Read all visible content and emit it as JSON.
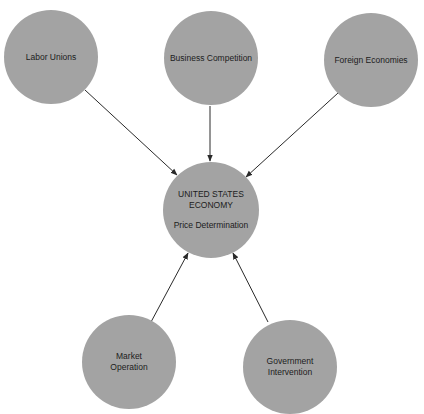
{
  "diagram": {
    "type": "influence-diagram",
    "colors": {
      "node_fill": "#a3a3a3",
      "text": "#1c1c1c",
      "arrow": "#2a2a2a",
      "background": "#ffffff"
    },
    "center_node": {
      "id": "us-economy",
      "title_lines": [
        "UNITED STATES",
        "ECONOMY"
      ],
      "subtitle": "Price Determination",
      "cx": 211,
      "cy": 210,
      "r": 48
    },
    "influence_nodes": [
      {
        "id": "labor-unions",
        "lines": [
          "Labor Unions"
        ],
        "cx": 51,
        "cy": 57,
        "r": 47
      },
      {
        "id": "business-competition",
        "lines": [
          "Business Competition"
        ],
        "cx": 211,
        "cy": 58,
        "r": 47
      },
      {
        "id": "foreign-economies",
        "lines": [
          "Foreign Economies"
        ],
        "cx": 371,
        "cy": 60,
        "r": 47
      },
      {
        "id": "market-operation",
        "lines": [
          "Market",
          "Operation"
        ],
        "cx": 129,
        "cy": 362,
        "r": 47
      },
      {
        "id": "government-intervention",
        "lines": [
          "Government",
          "Intervention"
        ],
        "cx": 290,
        "cy": 367,
        "r": 47
      }
    ],
    "arrows": [
      {
        "from": "labor-unions",
        "to": "us-economy",
        "x1": 85,
        "y1": 90,
        "x2": 177,
        "y2": 175
      },
      {
        "from": "business-competition",
        "to": "us-economy",
        "x1": 210,
        "y1": 106,
        "x2": 210,
        "y2": 161
      },
      {
        "from": "foreign-economies",
        "to": "us-economy",
        "x1": 338,
        "y1": 93,
        "x2": 246,
        "y2": 177
      },
      {
        "from": "market-operation",
        "to": "us-economy",
        "x1": 151,
        "y1": 322,
        "x2": 188,
        "y2": 253
      },
      {
        "from": "government-intervention",
        "to": "us-economy",
        "x1": 268,
        "y1": 322,
        "x2": 233,
        "y2": 253
      }
    ]
  }
}
